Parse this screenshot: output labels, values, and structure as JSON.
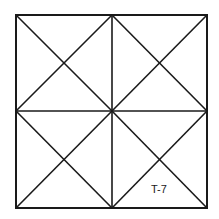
{
  "diagram": {
    "grid": {
      "rows": 2,
      "cols": 2
    },
    "label": "T-7",
    "line_color": "#1a1a1a",
    "background": "#ffffff"
  }
}
